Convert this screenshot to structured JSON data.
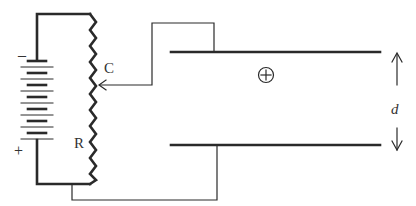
{
  "diagram": {
    "colors": {
      "ink": "#2a2a2a",
      "background": "#ffffff"
    },
    "labels": {
      "battery_negative": "–",
      "battery_positive": "+",
      "contact": "C",
      "resistor": "R",
      "charge": "+",
      "separation": "d"
    },
    "components": {
      "battery": {
        "cells": 8,
        "symbol": "battery-icon"
      },
      "resistor": {
        "type": "variable",
        "symbol": "zigzag-resistor-icon"
      },
      "slider": {
        "symbol": "arrow-contact-icon"
      },
      "plates": {
        "count": 2,
        "orientation": "horizontal"
      },
      "charge_particle": {
        "symbol": "circled-plus-icon"
      },
      "dimension_arrow": {
        "symbol": "double-arrow-icon"
      }
    }
  }
}
